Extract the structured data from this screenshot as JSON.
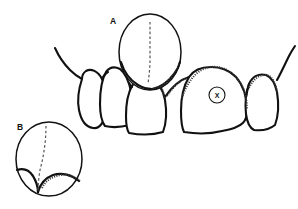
{
  "figure": {
    "background_color": "#ffffff",
    "ink_color": "#111111",
    "stipple_color": "#3a3a3a",
    "dash_color": "#555555",
    "width": 298,
    "height": 209
  },
  "labels": {
    "inset_a": "A",
    "inset_b": "B",
    "marker_x": "X"
  },
  "teeth": [
    {
      "name": "canine-left",
      "position": "far-left"
    },
    {
      "name": "lateral-incisor-left",
      "position": "left"
    },
    {
      "name": "central-incisor-left",
      "position": "center-left"
    },
    {
      "name": "central-incisor-right",
      "position": "center-right",
      "marked": "X"
    },
    {
      "name": "lateral-incisor-right",
      "position": "right"
    }
  ],
  "insets": [
    {
      "label": "A",
      "name": "magnifier-a",
      "cx": 150,
      "cy": 52,
      "rx": 31,
      "ry": 38,
      "contents": "dashed vertical midline over interdental region"
    },
    {
      "label": "B",
      "name": "magnifier-b",
      "cx": 49,
      "cy": 159,
      "rx": 33,
      "ry": 37,
      "contents": "dashed midline with interdental papilla col detail"
    }
  ],
  "markers": [
    {
      "label": "X",
      "name": "marker-x",
      "cx": 217,
      "cy": 95,
      "r": 8,
      "on_tooth": "central-incisor-right"
    }
  ]
}
